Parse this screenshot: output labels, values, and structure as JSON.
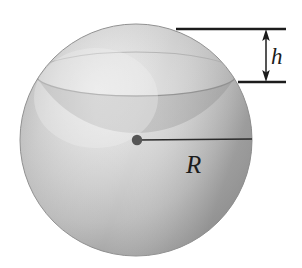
{
  "figure": {
    "kind": "geometry-diagram",
    "background_color": "#ffffff",
    "width": 302,
    "height": 268
  },
  "sphere": {
    "name": "shaded-sphere",
    "center_x": 136,
    "center_y": 140,
    "radius": 116,
    "fill_light": "#e8e8e8",
    "fill_mid": "#c3c3c3",
    "fill_dark": "#9d9d9d",
    "edge_color": "#8f8f8f",
    "highlight_x": 96,
    "highlight_y": 96
  },
  "cap": {
    "name": "spherical-cap-band",
    "ellipse_center_x": 136,
    "ellipse_center_y": 74,
    "ellipse_rx": 101,
    "ellipse_ry": 22,
    "band_color": "#b0b0b0",
    "band_opacity": 0.55
  },
  "dimension_h": {
    "label": "h",
    "name": "cap-height",
    "arrow_x": 266,
    "arrow_top_y": 30,
    "arrow_bottom_y": 82,
    "top_tick_x1": 176,
    "top_tick_x2": 286,
    "top_tick_y": 29,
    "bottom_tick_x1": 238,
    "bottom_tick_x2": 286,
    "bottom_tick_y": 82,
    "line_color": "#1c1c1c"
  },
  "dimension_R": {
    "label": "R",
    "name": "sphere-radius",
    "from_x": 137,
    "from_y": 140,
    "to_x": 252,
    "to_y": 139,
    "line_color": "#2a2a2a",
    "center_dot_radius": 5,
    "center_dot_color": "#555555"
  }
}
